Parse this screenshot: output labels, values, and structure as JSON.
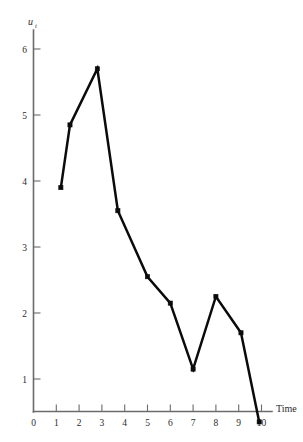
{
  "chart_data": {
    "type": "line",
    "title": "",
    "subtitle": "",
    "xlabel": "Time",
    "ylabel": "u",
    "ylabel_subscript": "t",
    "x": [
      1.2,
      1.6,
      2.8,
      3.7,
      5.0,
      6.0,
      7.0,
      8.0,
      9.1,
      9.9
    ],
    "values": [
      3.9,
      4.85,
      5.7,
      3.55,
      2.55,
      2.15,
      1.15,
      2.25,
      1.7,
      0.35
    ],
    "series": [
      {
        "name": "u_t",
        "values": [
          3.9,
          4.85,
          5.7,
          3.55,
          2.55,
          2.15,
          1.15,
          2.25,
          1.7,
          0.35
        ]
      }
    ],
    "xticks": [
      0,
      1,
      2,
      3,
      4,
      5,
      6,
      7,
      8,
      9,
      10
    ],
    "xtick_labels": [
      "0",
      "1",
      "2",
      "3",
      "4",
      "5",
      "6",
      "7",
      "8",
      "9",
      "10"
    ],
    "yticks": [
      1,
      2,
      3,
      4,
      5,
      6
    ],
    "ytick_labels": [
      "1",
      "2",
      "3",
      "4",
      "5",
      "6"
    ],
    "xlim": [
      0,
      10
    ],
    "ylim": [
      0,
      6.4
    ],
    "grid": false,
    "legend": "none",
    "marker": "filled-square",
    "line_color": "#0b0b0b",
    "axis_color": "#6b6b6b"
  },
  "axes": {
    "x_axis_title": "Time",
    "y_axis_title": "u",
    "y_axis_subscript": "t"
  }
}
